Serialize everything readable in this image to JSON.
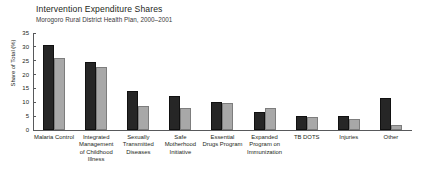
{
  "chart_data": {
    "type": "bar",
    "title": "Intervention Expenditure Shares",
    "subtitle": "Morogoro Rural District Health Plan, 2000–2001",
    "xlabel": "",
    "ylabel": "Share of Total (%)",
    "ylim": [
      0,
      35
    ],
    "yticks": [
      0,
      5,
      10,
      15,
      20,
      25,
      30,
      35
    ],
    "grid": false,
    "legend": "none",
    "categories": [
      "Malaria Control",
      "Integrated Management of Childhood Illness",
      "Sexually Transmitted Diseases",
      "Safe Motherhood Initiative",
      "Essential Drugs Program",
      "Expanded Program on Immunization",
      "TB DOTS",
      "Injuries",
      "Other"
    ],
    "series": [
      {
        "name": "dark",
        "color": "#262626",
        "values": [
          30.7,
          24.5,
          14.0,
          12.4,
          10.1,
          6.6,
          5.2,
          4.9,
          11.4
        ]
      },
      {
        "name": "light",
        "color": "#a8a8a8",
        "values": [
          26.0,
          22.7,
          8.7,
          7.8,
          9.8,
          7.8,
          4.8,
          3.9,
          1.8
        ]
      }
    ]
  }
}
